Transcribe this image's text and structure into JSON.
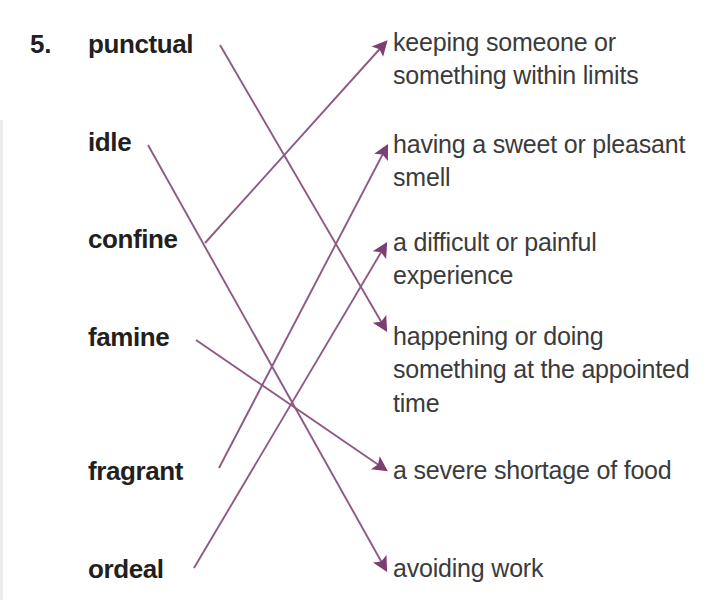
{
  "exercise": {
    "number": "5.",
    "partial_top_text": "",
    "line_color": "#8e5a82",
    "arrow_color": "#7b3f72",
    "word_color": "#231f20",
    "definition_color": "#3b3b3b",
    "background_color": "#ffffff"
  },
  "words": [
    {
      "id": "punctual",
      "label": "punctual",
      "x": 88,
      "y": 29
    },
    {
      "id": "idle",
      "label": "idle",
      "x": 88,
      "y": 127
    },
    {
      "id": "confine",
      "label": "confine",
      "x": 88,
      "y": 224
    },
    {
      "id": "famine",
      "label": "famine",
      "x": 88,
      "y": 322
    },
    {
      "id": "fragrant",
      "label": "fragrant",
      "x": 88,
      "y": 456
    },
    {
      "id": "ordeal",
      "label": "ordeal",
      "x": 88,
      "y": 554
    }
  ],
  "definitions": [
    {
      "id": "def-limits",
      "text": "keeping someone or something within limits",
      "y": 26
    },
    {
      "id": "def-smell",
      "text": "having a sweet or pleasant smell",
      "y": 128
    },
    {
      "id": "def-ordeal",
      "text": "a difficult or painful experience",
      "y": 226
    },
    {
      "id": "def-punctual",
      "text": "happening or doing something at the appointed time",
      "y": 320
    },
    {
      "id": "def-famine",
      "text": "a severe shortage of food",
      "y": 454
    },
    {
      "id": "def-idle",
      "text": "avoiding work",
      "y": 552
    }
  ],
  "connections": [
    {
      "id": "conn-punctual",
      "from": "punctual",
      "to": "def-punctual",
      "x1": 220,
      "y1": 45,
      "x2": 386,
      "y2": 330
    },
    {
      "id": "conn-idle",
      "from": "idle",
      "to": "def-idle",
      "x1": 148,
      "y1": 145,
      "x2": 386,
      "y2": 570
    },
    {
      "id": "conn-confine",
      "from": "confine",
      "to": "def-limits",
      "x1": 205,
      "y1": 243,
      "x2": 386,
      "y2": 42
    },
    {
      "id": "conn-famine",
      "from": "famine",
      "to": "def-famine",
      "x1": 196,
      "y1": 340,
      "x2": 386,
      "y2": 470
    },
    {
      "id": "conn-fragrant",
      "from": "fragrant",
      "to": "def-smell",
      "x1": 219,
      "y1": 468,
      "x2": 387,
      "y2": 146
    },
    {
      "id": "conn-ordeal",
      "from": "ordeal",
      "to": "def-ordeal",
      "x1": 194,
      "y1": 568,
      "x2": 386,
      "y2": 244
    }
  ]
}
